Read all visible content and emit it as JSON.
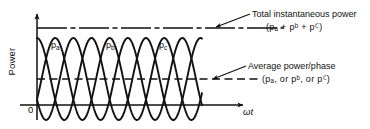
{
  "figure": {
    "axes": {
      "y_title": "Power",
      "x_title": "ωt",
      "origin": "0"
    },
    "curve_labels": {
      "pa": "p",
      "pa_sub": "a",
      "pb": "p",
      "pb_sub": "b",
      "pc": "p",
      "pc_sub": "c"
    },
    "annotations": {
      "total": {
        "title": "Total instantaneous power",
        "formula_prefix": "(p",
        "formula": "(pₐ + pᵇ + pꟲ)"
      },
      "average": {
        "title": "Average power/phase",
        "formula": "(pₐ, or pᵇ, or pꟲ)"
      }
    },
    "colors": {
      "ink": "#111111",
      "background": "#ffffff"
    }
  },
  "chart_data": {
    "type": "line",
    "xlabel": "ωt",
    "ylabel": "Power",
    "grid": false,
    "legend": "inline-curve-labels",
    "xlim": [
      0,
      3.0
    ],
    "ylim": [
      -0.5,
      2.2
    ],
    "x_unit": "cycles of 2π",
    "series": [
      {
        "name": "pₐ",
        "label": "p_a",
        "type": "sinusoid",
        "amplitude": 1.0,
        "offset": 1.0,
        "phase_deg": 0,
        "cycles": 3.0,
        "color": "#111111"
      },
      {
        "name": "pᵇ",
        "label": "p_b",
        "type": "sinusoid",
        "amplitude": 1.0,
        "offset": 1.0,
        "phase_deg": 120,
        "cycles": 3.0,
        "color": "#111111"
      },
      {
        "name": "pꟲ",
        "label": "p_c",
        "type": "sinusoid",
        "amplitude": 1.0,
        "offset": 1.0,
        "phase_deg": 240,
        "cycles": 3.0,
        "color": "#111111"
      }
    ],
    "reference_lines": [
      {
        "name": "total-instantaneous-power",
        "value": 1.5,
        "style": "dash-dot",
        "label": "Total instantaneous power"
      },
      {
        "name": "average-power-per-phase",
        "value": 1.0,
        "style": "dashed",
        "label": "Average power/phase"
      },
      {
        "name": "zero-axis",
        "value": 0,
        "style": "solid",
        "label": "0"
      }
    ]
  },
  "geometry": {
    "x_origin": 37,
    "y_baseline": 105,
    "y_average": 79,
    "y_total": 28,
    "y_peak": 38,
    "y_trough": 116,
    "period_px": 54.5,
    "curve_end_x": 202,
    "x_axis_end": 246,
    "y_axis_top": 12
  }
}
